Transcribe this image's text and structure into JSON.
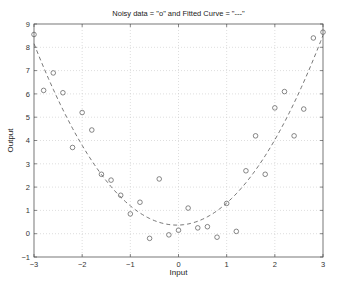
{
  "chart_data": {
    "type": "scatter",
    "title": "Noisy data = \"o\" and Fitted Curve = \"---\"",
    "xlabel": "Input",
    "ylabel": "Output",
    "xlim": [
      -3,
      3
    ],
    "ylim": [
      -1,
      9
    ],
    "xticks": [
      -3,
      -2,
      -1,
      0,
      1,
      2,
      3
    ],
    "yticks": [
      -1,
      0,
      1,
      2,
      3,
      4,
      5,
      6,
      7,
      8,
      9
    ],
    "grid": true,
    "legend": null,
    "series": [
      {
        "name": "Noisy data",
        "marker": "o",
        "x": [
          -3.0,
          -2.8,
          -2.6,
          -2.4,
          -2.2,
          -2.0,
          -1.8,
          -1.6,
          -1.4,
          -1.2,
          -1.0,
          -0.8,
          -0.6,
          -0.4,
          -0.2,
          0.0,
          0.2,
          0.4,
          0.6,
          0.8,
          1.0,
          1.2,
          1.4,
          1.6,
          1.8,
          2.0,
          2.2,
          2.4,
          2.6,
          2.8,
          3.0
        ],
        "y": [
          8.55,
          6.15,
          6.9,
          6.05,
          3.7,
          5.2,
          4.45,
          2.55,
          2.3,
          1.65,
          0.85,
          1.35,
          -0.2,
          2.35,
          -0.05,
          0.15,
          1.1,
          0.25,
          0.3,
          -0.15,
          1.3,
          0.1,
          2.7,
          4.2,
          2.55,
          5.4,
          6.1,
          4.2,
          5.35,
          8.4,
          8.65
        ]
      },
      {
        "name": "Fitted Curve",
        "style": "dashed",
        "equation": "y = 0.885x^2 + 0.06x + 0.37",
        "coefficients": {
          "a": 0.885,
          "b": 0.06,
          "c": 0.37
        },
        "x_range": [
          -3,
          3
        ]
      }
    ]
  },
  "plot": {
    "title": "Noisy data = \"o\" and Fitted Curve = \"---\"",
    "xlabel": "Input",
    "ylabel": "Output"
  }
}
